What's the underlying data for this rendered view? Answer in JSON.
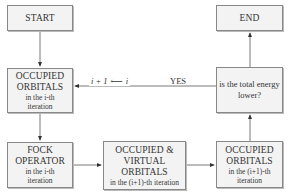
{
  "diagram": {
    "nodes": {
      "start": {
        "label": "START"
      },
      "occ_i": {
        "title1": "OCCUPIED",
        "title2": "ORBITALS",
        "sub1": "in the i-th",
        "sub2": "iteration"
      },
      "fock": {
        "title1": "FOCK",
        "title2": "OPERATOR",
        "sub1": "in the i-th",
        "sub2": "iteration"
      },
      "occvirt": {
        "title1": "OCCUPIED &",
        "title2": "VIRTUAL",
        "title3": "ORBITALS",
        "sub1": "in the (i+1)-th iteration"
      },
      "occ_i1": {
        "title1": "OCCUPIED",
        "title2": "ORBITALS",
        "sub1": "in the (i+1)-th",
        "sub2": "iteration"
      },
      "decision": {
        "line1": "is the total energy",
        "line2": "lower?"
      },
      "end": {
        "label": "END"
      }
    },
    "edges": {
      "yes_label": "YES",
      "increment_label_left": "i + 1",
      "increment_label_right": "i"
    }
  }
}
